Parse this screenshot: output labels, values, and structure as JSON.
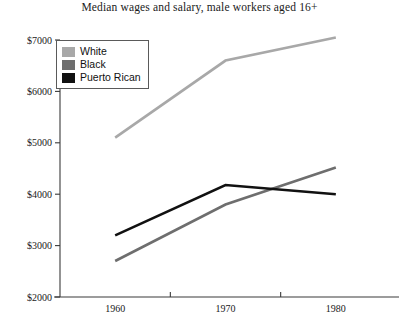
{
  "chart_data": {
    "type": "line",
    "title": "Median wages and salary, male workers aged 16+",
    "xlabel": "",
    "ylabel": "",
    "x": [
      1960,
      1970,
      1980
    ],
    "categories": [
      "1960",
      "1970",
      "1980"
    ],
    "xtick_labels": [
      "1960",
      "1970",
      "1980"
    ],
    "ytick_labels": [
      "$2000",
      "$3000",
      "$4000",
      "$5000",
      "$6000",
      "$7000"
    ],
    "ytick_values": [
      2000,
      3000,
      4000,
      5000,
      6000,
      7000
    ],
    "ylim": [
      2000,
      7000
    ],
    "xlim": [
      1955,
      1985
    ],
    "grid": false,
    "legend_position": "top-left",
    "series": [
      {
        "name": "White",
        "values": [
          5100,
          6600,
          7050
        ],
        "color": "#a8a8a8"
      },
      {
        "name": "Black",
        "values": [
          2700,
          3800,
          4520
        ],
        "color": "#6e6e6e"
      },
      {
        "name": "Puerto Rican",
        "values": [
          3200,
          4180,
          4000
        ],
        "color": "#111111"
      }
    ]
  },
  "legend": {
    "items": [
      {
        "label": "White",
        "color": "#a8a8a8"
      },
      {
        "label": "Black",
        "color": "#6e6e6e"
      },
      {
        "label": "Puerto Rican",
        "color": "#111111"
      }
    ]
  },
  "axes": {
    "axis_color": "#3a3a3a"
  }
}
